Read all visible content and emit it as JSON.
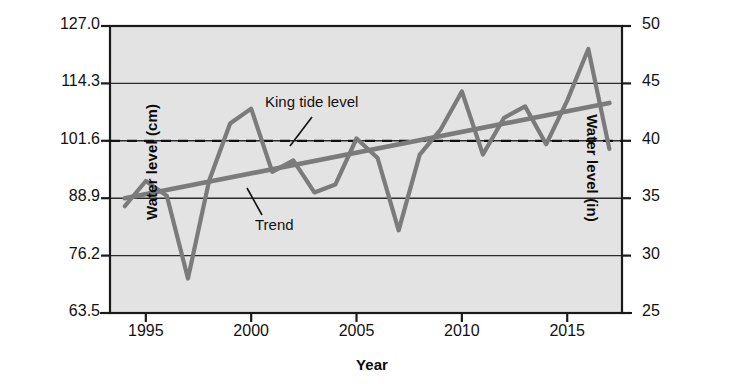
{
  "chart_data": {
    "type": "line",
    "title": "",
    "xlabel": "Year",
    "ylabel": "Water level (cm)",
    "ylabel_right": "Water level (in)",
    "xlim": [
      1993.3,
      2017.6
    ],
    "ylim_cm": [
      63.5,
      127.0
    ],
    "ylim_in": [
      25,
      50
    ],
    "grid": true,
    "legend_position": "inline-annotations",
    "plot_background": "#e3e3e3",
    "x": [
      1994,
      1995,
      1996,
      1997,
      1998,
      1999,
      2000,
      2001,
      2002,
      2003,
      2004,
      2005,
      2006,
      2007,
      2008,
      2009,
      2010,
      2011,
      2012,
      2013,
      2014,
      2015,
      2016,
      2017
    ],
    "xticks": [
      1995,
      2000,
      2005,
      2010,
      2015
    ],
    "xtick_labels": [
      "1995",
      "2000",
      "2005",
      "2010",
      "2015"
    ],
    "yticks_cm": [
      63.5,
      76.2,
      88.9,
      101.6,
      114.3,
      127.0
    ],
    "ytick_labels_cm": [
      "63.5",
      "76.2",
      "88.9",
      "101.6",
      "114.3",
      "127.0"
    ],
    "yticks_in": [
      25,
      30,
      35,
      40,
      45,
      50
    ],
    "ytick_labels_in": [
      "25",
      "30",
      "35",
      "40",
      "45",
      "50"
    ],
    "series": [
      {
        "name": "Water level",
        "color": "#7b7b7b",
        "units": "in",
        "values": [
          34.3,
          36.5,
          35.2,
          28.0,
          36.5,
          41.5,
          42.8,
          37.3,
          38.3,
          35.5,
          36.2,
          40.2,
          38.5,
          32.2,
          38.8,
          41.0,
          44.3,
          38.8,
          42.0,
          43.0,
          39.7,
          43.5,
          48.0,
          39.3
        ],
        "values_cm": [
          87.1,
          92.7,
          89.4,
          71.1,
          92.7,
          105.4,
          108.7,
          94.7,
          97.3,
          90.2,
          91.9,
          102.1,
          97.8,
          81.8,
          98.6,
          104.1,
          112.5,
          98.6,
          106.7,
          109.2,
          100.8,
          110.5,
          121.9,
          99.8
        ]
      },
      {
        "name": "Trend",
        "color": "#7b7b7b",
        "units": "in",
        "type": "trend",
        "x": [
          1994,
          2017
        ],
        "values": [
          35.0,
          43.3
        ],
        "values_cm": [
          88.9,
          110.0
        ]
      },
      {
        "name": "King tide level",
        "color": "#111111",
        "units": "in",
        "type": "hline-dashed",
        "value": 40,
        "value_cm": 101.6
      }
    ],
    "annotations": [
      {
        "id": "king-tide",
        "text": "King tide level",
        "points_to": "king tide dashed line"
      },
      {
        "id": "trend",
        "text": "Trend",
        "points_to": "trend line"
      }
    ]
  },
  "labels": {
    "y_left_title": "Water level (cm)",
    "y_right_title": "Water level (in)",
    "x_title": "Year",
    "annotation_king_tide": "King tide level",
    "annotation_trend": "Trend"
  }
}
